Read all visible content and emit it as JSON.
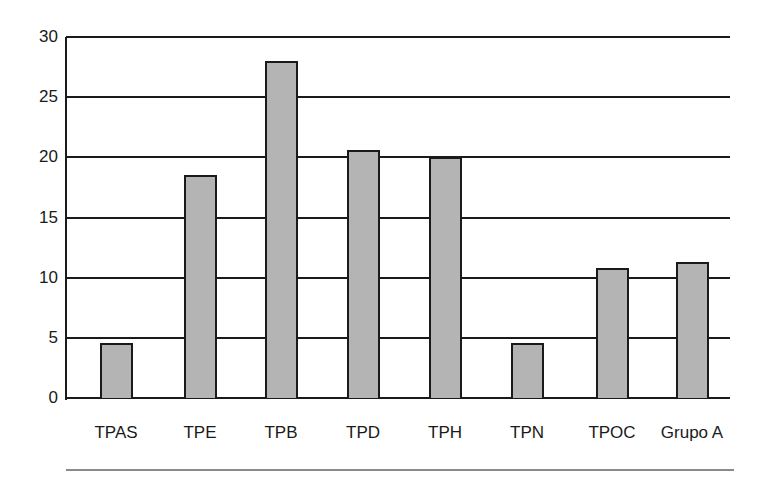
{
  "chart_data": {
    "type": "bar",
    "title": "",
    "xlabel": "",
    "ylabel": "",
    "categories": [
      "TPAS",
      "TPE",
      "TPB",
      "TPD",
      "TPH",
      "TPN",
      "TPOC",
      "Grupo A"
    ],
    "values": [
      4.6,
      18.5,
      28,
      20.6,
      20,
      4.6,
      10.8,
      11.3
    ],
    "ylim": [
      0,
      30
    ],
    "yticks": [
      0,
      5,
      10,
      15,
      20,
      25,
      30
    ],
    "grid": true,
    "legend": null,
    "colors": {
      "bar_fill": "#b4b4b4",
      "bar_edge": "#1a1a1a",
      "grid": "#1a1a1a"
    }
  }
}
